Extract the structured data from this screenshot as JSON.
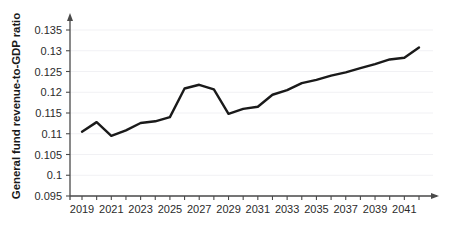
{
  "chart_data": {
    "type": "line",
    "title": "",
    "xlabel": "",
    "ylabel": "General fund revenue-to-GDP ratio",
    "ylim": [
      0.095,
      0.135
    ],
    "xlim": [
      2019,
      2042
    ],
    "grid": true,
    "legend": null,
    "y_ticks": [
      "0.095",
      "0.1",
      "0.105",
      "0.11",
      "0.115",
      "0.12",
      "0.125",
      "0.13",
      "0.135"
    ],
    "y_tick_values": [
      0.095,
      0.1,
      0.105,
      0.11,
      0.115,
      0.12,
      0.125,
      0.13,
      0.135
    ],
    "x_tick_labels": [
      "2019",
      "2021",
      "2023",
      "2025",
      "2027",
      "2029",
      "2031",
      "2033",
      "2035",
      "2037",
      "2039",
      "2041"
    ],
    "x_tick_values": [
      2019,
      2021,
      2023,
      2025,
      2027,
      2029,
      2031,
      2033,
      2035,
      2037,
      2039,
      2041
    ],
    "x": [
      2019,
      2020,
      2021,
      2022,
      2023,
      2024,
      2025,
      2026,
      2027,
      2028,
      2029,
      2030,
      2031,
      2032,
      2033,
      2034,
      2035,
      2036,
      2037,
      2038,
      2039,
      2040,
      2041,
      2042
    ],
    "values": [
      0.1105,
      0.1128,
      0.1095,
      0.1108,
      0.1126,
      0.113,
      0.114,
      0.1209,
      0.1218,
      0.1207,
      0.1148,
      0.116,
      0.1165,
      0.1194,
      0.1205,
      0.1222,
      0.123,
      0.124,
      0.1248,
      0.1258,
      0.1268,
      0.1279,
      0.1283,
      0.1308
    ],
    "line_color": "#1a1a1a",
    "line_width": 2.4,
    "axis_color": "#4a4a4a",
    "grid_color": "#f1f1f4",
    "background_color": "#ffffff"
  }
}
